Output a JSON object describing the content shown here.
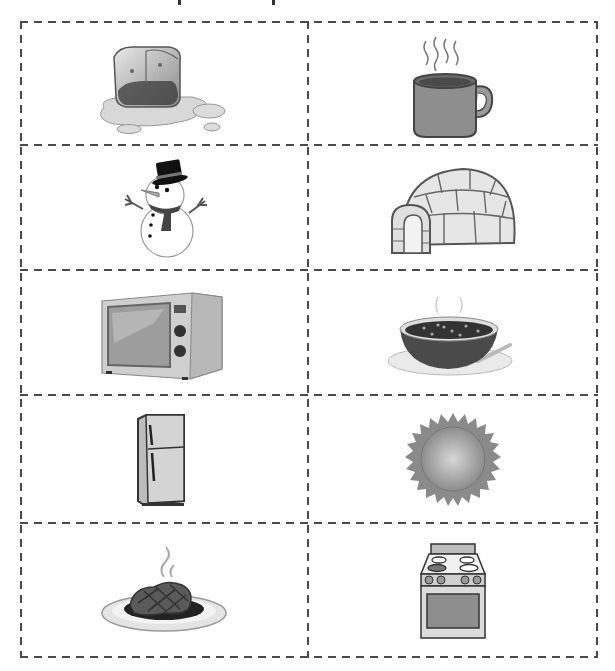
{
  "document": {
    "type": "cut-out picture cards",
    "layout": {
      "columns": 2,
      "rows": 5,
      "border_style": "dashed",
      "border_color": "#4a4a4a"
    },
    "cards": [
      {
        "row": 1,
        "col": 1,
        "label": "Melting ice cube",
        "icon": "ice-cube-icon"
      },
      {
        "row": 1,
        "col": 2,
        "label": "Hot mug of drink",
        "icon": "hot-mug-icon"
      },
      {
        "row": 2,
        "col": 1,
        "label": "Snowman",
        "icon": "snowman-icon"
      },
      {
        "row": 2,
        "col": 2,
        "label": "Igloo",
        "icon": "igloo-icon"
      },
      {
        "row": 3,
        "col": 1,
        "label": "Microwave oven",
        "icon": "microwave-icon"
      },
      {
        "row": 3,
        "col": 2,
        "label": "Bowl of hot soup",
        "icon": "soup-bowl-icon"
      },
      {
        "row": 4,
        "col": 1,
        "label": "Refrigerator",
        "icon": "refrigerator-icon"
      },
      {
        "row": 4,
        "col": 2,
        "label": "Sun",
        "icon": "sun-icon"
      },
      {
        "row": 5,
        "col": 1,
        "label": "Cooked steak on plate",
        "icon": "steak-icon"
      },
      {
        "row": 5,
        "col": 2,
        "label": "Stove with oven",
        "icon": "stove-icon"
      }
    ]
  }
}
